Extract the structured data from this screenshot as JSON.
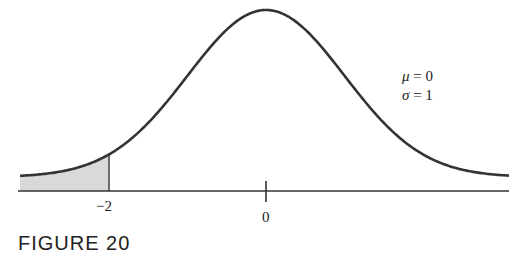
{
  "chart_data": {
    "type": "area",
    "title": "",
    "distribution": "standard normal",
    "parameters": {
      "mu": 0,
      "sigma": 1
    },
    "x_ticks": [
      {
        "value": -2,
        "label": "−2"
      },
      {
        "value": 0,
        "label": "0"
      }
    ],
    "shaded_region": {
      "from": "-inf",
      "to": -2,
      "color": "#d9d9d9"
    },
    "xlim": [
      -3.1,
      3.1
    ],
    "annotations": [
      "μ = 0",
      "σ = 1"
    ],
    "xlabel": "",
    "ylabel": "",
    "grid": false
  },
  "labels": {
    "tick_neg2": "−2",
    "tick_0": "0",
    "mu_symbol": "μ",
    "mu_rest": " = 0",
    "sigma_symbol": "σ",
    "sigma_rest": " = 1",
    "figure_caption": "FIGURE 20"
  },
  "colors": {
    "curve": "#333333",
    "shade": "#d9d9d9",
    "axis": "#333333"
  }
}
